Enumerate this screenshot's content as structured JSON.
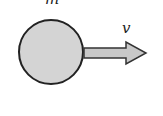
{
  "diagram": {
    "mass_label": "m",
    "velocity_label": "v",
    "colors": {
      "ball_fill": "#d4d4d4",
      "arrow_fill": "#c8c8c8",
      "stroke": "#222222"
    }
  }
}
